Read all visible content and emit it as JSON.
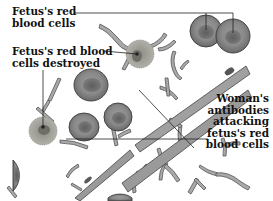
{
  "figure": {
    "labels": {
      "fetus_rbc": [
        "Fetus's red",
        "blood cells"
      ],
      "fetus_rbc_destroyed": [
        "Fetus's red blood",
        "cells destroyed"
      ],
      "antibodies": [
        "Woman's",
        "antibodies",
        "attacking",
        "fetus's red",
        "blood cells"
      ]
    },
    "colors": {
      "cell_fill": "#8a8a8a",
      "cell_inner": "#6e6e6e",
      "cell_stroke": "#3a3a3a",
      "antibody_fill": "#a9a9a9",
      "destroyed_cell": "#a8a8a0",
      "leader_line": "#222222",
      "background": "#ffffff"
    }
  }
}
